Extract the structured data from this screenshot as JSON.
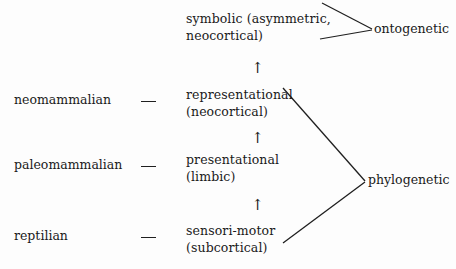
{
  "diagram": {
    "background_color": "#fdfdfd",
    "line_color": "#1f1f1f",
    "text_color": "#1a1a1a",
    "taxa": [
      {
        "id": "neomammalian",
        "label": "neomammalian"
      },
      {
        "id": "paleomammalian",
        "label": "paleomammalian"
      },
      {
        "id": "reptilian",
        "label": "reptilian"
      }
    ],
    "stages": [
      {
        "id": "symbolic",
        "line1": "symbolic (asymmetric,",
        "line2": "neocortical)"
      },
      {
        "id": "representational",
        "line1": "representational",
        "line2": "(neocortical)"
      },
      {
        "id": "presentational",
        "line1": "presentational",
        "line2": "(limbic)"
      },
      {
        "id": "sensorimotor",
        "line1": "sensori-motor",
        "line2": "(subcortical)"
      }
    ],
    "groups": [
      {
        "id": "ontogenetic",
        "label": "ontogenetic"
      },
      {
        "id": "phylogenetic",
        "label": "phylogenetic"
      }
    ],
    "arrows": {
      "glyph": "↑",
      "count": 3,
      "direction": "up"
    },
    "connector_dash": "—"
  }
}
